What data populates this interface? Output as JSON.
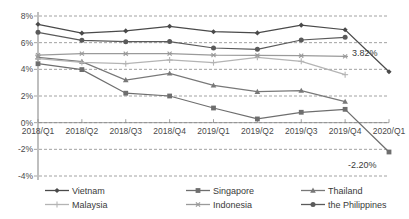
{
  "chart_data": {
    "type": "line",
    "title": "",
    "xlabel": "",
    "ylabel": "",
    "ylim": [
      -4,
      8
    ],
    "ytick_step": 2,
    "grid": true,
    "gridlines_style": "dashed-horizontal",
    "legend_position": "bottom",
    "legend_columns": 3,
    "x": [
      "2018/Q1",
      "2018/Q2",
      "2018/Q3",
      "2018/Q4",
      "2019/Q1",
      "2019/Q2",
      "2019/Q3",
      "2019/Q4",
      "2020/Q1"
    ],
    "ytick_labels": [
      "8%",
      "6%",
      "4%",
      "2%",
      "0%",
      "-2%",
      "-4%"
    ],
    "ytick_values": [
      8,
      6,
      4,
      2,
      0,
      -2,
      -4
    ],
    "series": [
      {
        "name": "Vietnam",
        "marker": "diamond",
        "color": "#4a4a4a",
        "values": [
          7.38,
          6.71,
          6.88,
          7.23,
          6.82,
          6.73,
          7.31,
          6.97,
          3.82
        ]
      },
      {
        "name": "Singapore",
        "marker": "square",
        "color": "#6e6e6e",
        "values": [
          4.42,
          3.98,
          2.21,
          2.0,
          1.1,
          0.28,
          0.78,
          1.0,
          -2.2
        ]
      },
      {
        "name": "Thailand",
        "marker": "triangle",
        "color": "#787878",
        "values": [
          4.9,
          4.58,
          3.2,
          3.7,
          2.8,
          2.32,
          2.4,
          1.58,
          null
        ]
      },
      {
        "name": "Malaysia",
        "marker": "plus",
        "color": "#b4b4b4",
        "values": [
          4.8,
          4.52,
          4.42,
          4.7,
          4.5,
          4.9,
          4.6,
          3.6,
          null
        ]
      },
      {
        "name": "Indonesia",
        "marker": "asterisk",
        "color": "#9a9a9a",
        "values": [
          5.06,
          5.18,
          5.17,
          5.18,
          5.07,
          5.05,
          5.02,
          4.97,
          null
        ]
      },
      {
        "name": "the Philippines",
        "marker": "circle",
        "color": "#5a5a5a",
        "values": [
          6.78,
          6.18,
          6.07,
          6.08,
          5.6,
          5.5,
          6.2,
          6.4,
          null
        ]
      }
    ],
    "annotations": [
      {
        "id": "vietnam-end",
        "text": "3.82%",
        "series": "Vietnam",
        "x": "2020/Q1",
        "value": 3.82
      },
      {
        "id": "singapore-end",
        "text": "-2.20%",
        "series": "Singapore",
        "x": "2020/Q1",
        "value": -2.2
      }
    ]
  }
}
